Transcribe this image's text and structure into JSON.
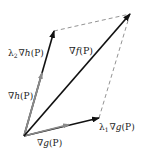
{
  "diagram": {
    "points": {
      "origin": [
        24,
        136
      ],
      "grad_g_tip": [
        69,
        124
      ],
      "lambda1_grad_g_tip": [
        99,
        118
      ],
      "grad_h_tip": [
        42,
        73
      ],
      "lambda2_grad_h_tip": [
        54,
        31
      ],
      "grad_f_tip": [
        130,
        14
      ]
    },
    "colors": {
      "primary_vector": "#111111",
      "basis_vector": "#8a8a8a",
      "dashed_line": "#777777",
      "text": "#222222",
      "background": "#ffffff"
    },
    "labels": {
      "grad_f": {
        "nabla": "∇",
        "fn": "f",
        "arg": "(P)"
      },
      "lambda2_grad_h": {
        "lambda": "λ",
        "sub": "2",
        "nabla": "∇",
        "fn": "h",
        "arg": "(P)"
      },
      "grad_h": {
        "nabla": "∇",
        "fn": "h",
        "arg": "(P)"
      },
      "grad_g": {
        "nabla": "∇",
        "fn": "g",
        "arg": "(P)"
      },
      "lambda1_grad_g": {
        "lambda": "λ",
        "sub": "1",
        "nabla": "∇",
        "fn": "g",
        "arg": "(P)"
      }
    }
  }
}
